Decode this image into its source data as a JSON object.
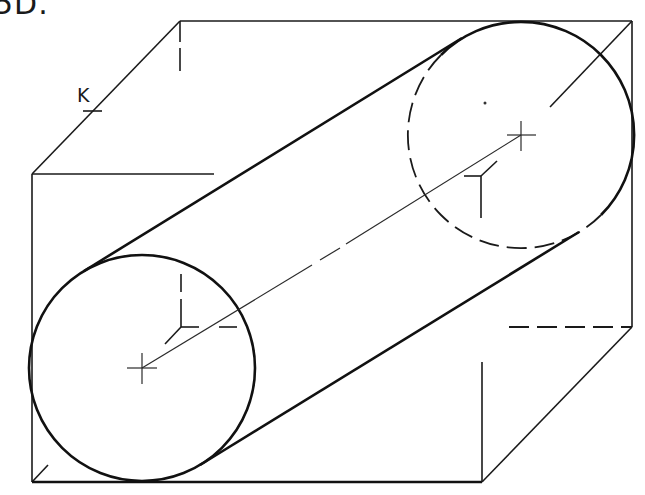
{
  "figure": {
    "label": "5D.",
    "point_label": "K",
    "colors": {
      "line": "#1a1a1a",
      "background": "#ffffff"
    }
  },
  "box": {
    "front_face": {
      "left": 32,
      "top": 174,
      "right": 482,
      "bottom": 482
    },
    "back_face": {
      "left": 180,
      "top": 21,
      "right": 632,
      "bottom": 327
    }
  },
  "cylinder": {
    "front_end": {
      "cx": 142,
      "cy": 368,
      "r": 113
    },
    "back_end": {
      "cx": 521,
      "cy": 135,
      "r": 113
    }
  }
}
